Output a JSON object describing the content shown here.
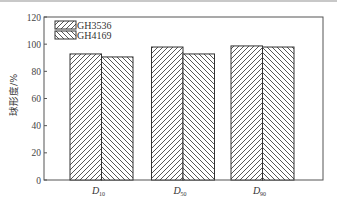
{
  "chart_data": {
    "type": "bar",
    "title": "",
    "xlabel": "",
    "ylabel": "球形度/%",
    "ylim": [
      0,
      120
    ],
    "yticks": [
      0,
      20,
      40,
      60,
      80,
      100,
      120
    ],
    "categories": [
      "D10",
      "D50",
      "D90"
    ],
    "category_labels": [
      {
        "main": "D",
        "sub": "10"
      },
      {
        "main": "D",
        "sub": "50"
      },
      {
        "main": "D",
        "sub": "90"
      }
    ],
    "series": [
      {
        "name": "GH3536",
        "pattern": "forward-hatch",
        "values": [
          92.8,
          97.9,
          98.7
        ]
      },
      {
        "name": "GH4169",
        "pattern": "back-hatch",
        "values": [
          90.6,
          92.8,
          97.9
        ]
      }
    ],
    "legend_position": "upper-left",
    "grid": false
  },
  "colors": {
    "axis": "#555555",
    "hatch": "#444444",
    "background": "#ffffff"
  }
}
